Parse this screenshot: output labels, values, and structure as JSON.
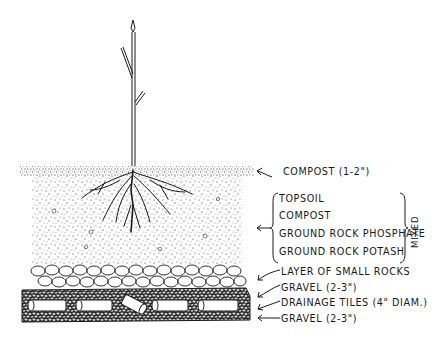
{
  "diagram": {
    "colors": {
      "ink": "#1a1a1a",
      "background": "#ffffff"
    },
    "layers": [
      {
        "id": "compost-top",
        "label": "COMPOST (1-2\")"
      },
      {
        "id": "mixed-soil",
        "items": [
          "TOPSOIL",
          "COMPOST",
          "GROUND ROCK PHOSPHATE",
          "GROUND ROCK POTASH"
        ],
        "group_label": "MIXED"
      },
      {
        "id": "small-rocks",
        "label": "LAYER OF SMALL ROCKS"
      },
      {
        "id": "gravel-upper",
        "label": "GRAVEL (2-3\")"
      },
      {
        "id": "drainage-tiles",
        "label": "DRAINAGE TILES (4\" DIAM.)"
      },
      {
        "id": "gravel-lower",
        "label": "GRAVEL (2-3\")"
      }
    ]
  }
}
